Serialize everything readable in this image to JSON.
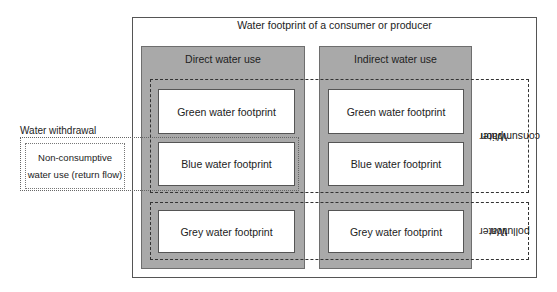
{
  "diagram": {
    "title": "Water footprint of a consumer or producer",
    "columns": [
      {
        "label": "Direct water use"
      },
      {
        "label": "Indirect water use"
      }
    ],
    "footprints": {
      "green": "Green water footprint",
      "blue": "Blue water footprint",
      "grey": "Grey water footprint"
    },
    "groups": {
      "consumption": {
        "line1": "Water",
        "line2": "consumption"
      },
      "pollution": {
        "line1": "Water",
        "line2": "pollution"
      }
    },
    "withdrawal": {
      "label": "Water withdrawal",
      "non_consumptive_line1": "Non-consumptive",
      "non_consumptive_line2": "water use (return flow)"
    },
    "colors": {
      "column_fill": "#a9a9a9",
      "box_fill": "#ffffff",
      "border": "#555555"
    }
  }
}
